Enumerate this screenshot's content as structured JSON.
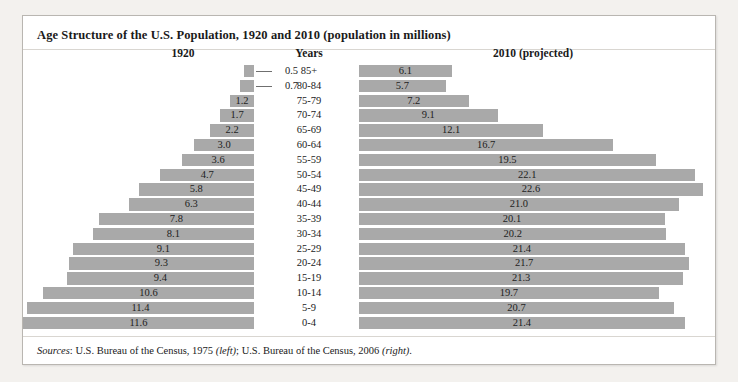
{
  "figure": {
    "title": "Age Structure of the U.S. Population, 1920 and 2010 (population in millions)",
    "headers": {
      "left": "1920",
      "center": "Years",
      "right": "2010 (projected)"
    },
    "source": {
      "label": "Sources",
      "colon": ": ",
      "left_text": "U.S. Bureau of the Census, 1975 ",
      "left_side": "(left)",
      "mid_text": "; U.S. Bureau of the Census, 2006 ",
      "right_side": "(right)",
      "period": "."
    }
  },
  "colors": {
    "bar": "#a9a9a9",
    "frame": "#b9b6b1",
    "page_background": "#f3f1ee",
    "panel_background": "#ffffff",
    "text": "#1a1a1a"
  },
  "chart_data": {
    "type": "bar",
    "title": "Age Structure of the U.S. Population, 1920 and 2010 (population in millions)",
    "xlabel": "Population (millions)",
    "ylabel": "Years",
    "orientation": "horizontal",
    "layout": "population-pyramid",
    "grid": false,
    "legend": "none",
    "axis_max": 23.0,
    "categories": [
      "85+",
      "80-84",
      "75-79",
      "70-74",
      "65-69",
      "60-64",
      "55-59",
      "50-54",
      "45-49",
      "40-44",
      "35-39",
      "30-34",
      "25-29",
      "20-24",
      "15-19",
      "10-14",
      "5-9",
      "0-4"
    ],
    "series": [
      {
        "name": "1920",
        "side": "left",
        "values": [
          0.5,
          0.7,
          1.2,
          1.7,
          2.2,
          3.0,
          3.6,
          4.7,
          5.8,
          6.3,
          7.8,
          8.1,
          9.1,
          9.3,
          9.4,
          10.6,
          11.4,
          11.6
        ],
        "labels": [
          "0.5",
          "0.7",
          "1.2",
          "1.7",
          "2.2",
          "3.0",
          "3.6",
          "4.7",
          "5.8",
          "6.3",
          "7.8",
          "8.1",
          "9.1",
          "9.3",
          "9.4",
          "10.6",
          "11.4",
          "11.6"
        ],
        "label_placement": [
          "callout",
          "callout",
          "inside",
          "inside",
          "inside",
          "inside",
          "inside",
          "inside",
          "inside",
          "inside",
          "inside",
          "inside",
          "inside",
          "inside",
          "inside",
          "inside",
          "inside",
          "inside"
        ]
      },
      {
        "name": "2010 (projected)",
        "side": "right",
        "values": [
          6.1,
          5.7,
          7.2,
          9.1,
          12.1,
          16.7,
          19.5,
          22.1,
          22.6,
          21.0,
          20.1,
          20.2,
          21.4,
          21.7,
          21.3,
          19.7,
          20.7,
          21.4
        ],
        "labels": [
          "6.1",
          "5.7",
          "7.2",
          "9.1",
          "12.1",
          "16.7",
          "19.5",
          "22.1",
          "22.6",
          "21.0",
          "20.1",
          "20.2",
          "21.4",
          "21.7",
          "21.3",
          "19.7",
          "20.7",
          "21.4"
        ],
        "label_placement": [
          "inside",
          "inside",
          "inside",
          "inside",
          "inside",
          "inside",
          "inside",
          "inside",
          "inside",
          "inside",
          "inside",
          "inside",
          "inside",
          "inside",
          "inside",
          "inside",
          "inside",
          "inside"
        ]
      }
    ]
  }
}
